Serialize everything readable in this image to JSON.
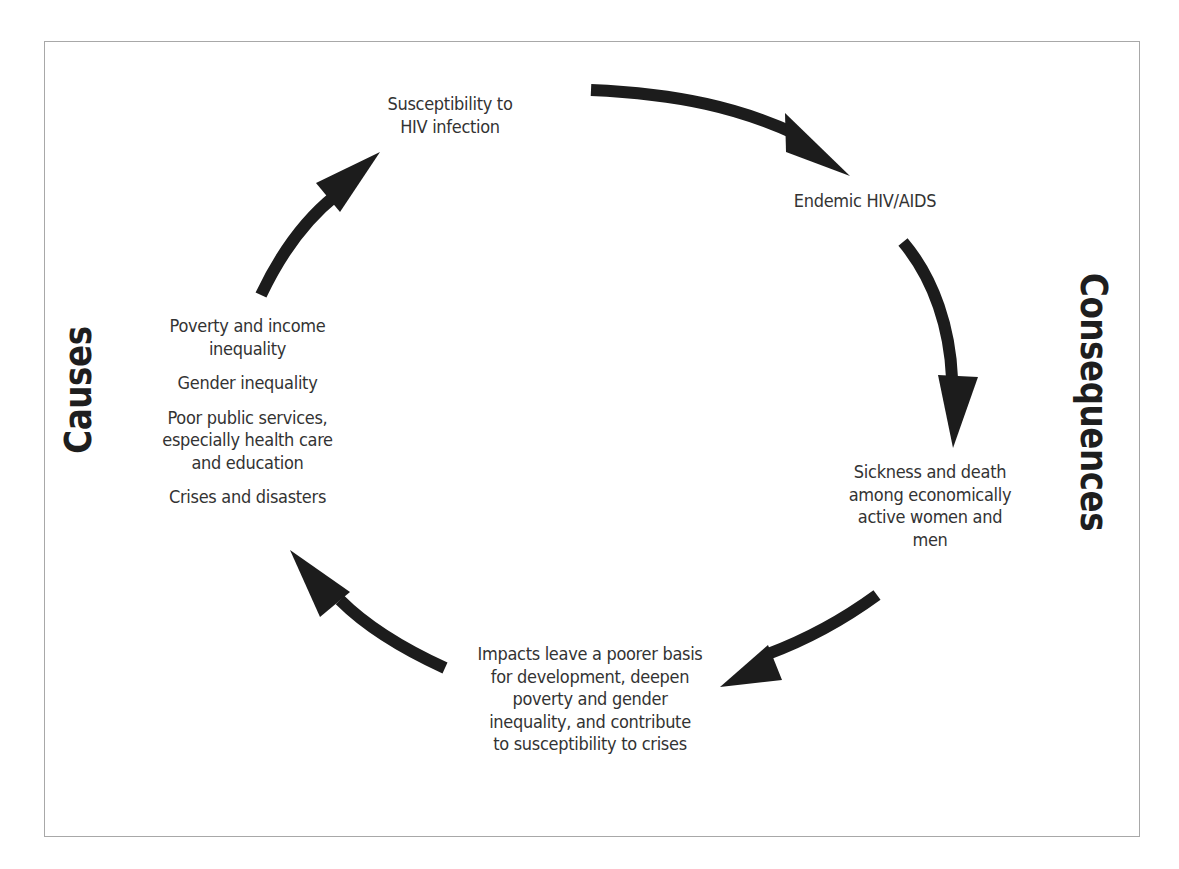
{
  "diagram": {
    "type": "cycle",
    "side_labels": {
      "left": "Causes",
      "right": "Consequences"
    },
    "nodes": {
      "susceptibility": [
        "Susceptibility to",
        "HIV infection"
      ],
      "endemic": [
        "Endemic HIV/AIDS"
      ],
      "sickness": [
        "Sickness and death",
        "among economically",
        "active women and",
        "men"
      ],
      "impacts": [
        "Impacts leave a poorer basis",
        "for development, deepen",
        "poverty and gender",
        "inequality, and contribute",
        "to susceptibility to crises"
      ]
    },
    "causes": [
      [
        "Poverty and income",
        "inequality"
      ],
      [
        "Gender inequality"
      ],
      [
        "Poor public services,",
        "especially health care",
        "and education"
      ],
      [
        "Crises and disasters"
      ]
    ],
    "flow": [
      {
        "from": "susceptibility",
        "to": "endemic"
      },
      {
        "from": "endemic",
        "to": "sickness"
      },
      {
        "from": "sickness",
        "to": "impacts"
      },
      {
        "from": "impacts",
        "to": "causes"
      },
      {
        "from": "causes",
        "to": "susceptibility"
      }
    ],
    "colors": {
      "text": "#333333",
      "arrow": "#1c1c1c",
      "border": "#a8a8a8"
    }
  }
}
